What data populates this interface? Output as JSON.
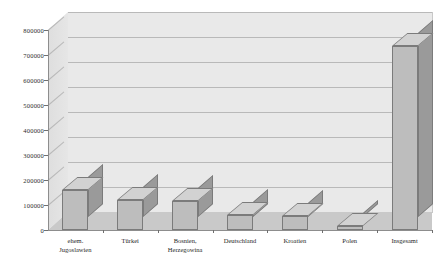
{
  "chart_data": {
    "type": "bar",
    "title": "",
    "subtitle": "",
    "xlabel": "",
    "ylabel": "",
    "ylim": [
      0,
      800000
    ],
    "ytick_step": 100000,
    "grid": true,
    "legend": "none",
    "style": "3d-column-grayscale",
    "categories": [
      "ehem.\nJugoslawien",
      "Türkei",
      "Bosnien,\nHerzegowina",
      "Deutschland",
      "Kroatien",
      "Polen",
      "Insgesamt"
    ],
    "values": [
      160000,
      120000,
      115000,
      60000,
      55000,
      15000,
      735000
    ],
    "ytick_labels": [
      "0",
      "100000",
      "200000",
      "300000",
      "400000",
      "500000",
      "600000",
      "700000",
      "800000"
    ],
    "ytick_values": [
      0,
      100000,
      200000,
      300000,
      400000,
      500000,
      600000,
      700000,
      800000
    ],
    "colors": {
      "bar_front": "#bdbdbd",
      "bar_top": "#d2d2d2",
      "bar_side": "#9a9a9a",
      "bar_edge": "#7b7b7b",
      "plot_background": "#e9e9e9",
      "floor": "#c9c9c9",
      "gridline": "#b9b9b9",
      "axis": "#8d8d8d",
      "text": "#1f1f1f",
      "page_background": "#ffffff"
    }
  }
}
